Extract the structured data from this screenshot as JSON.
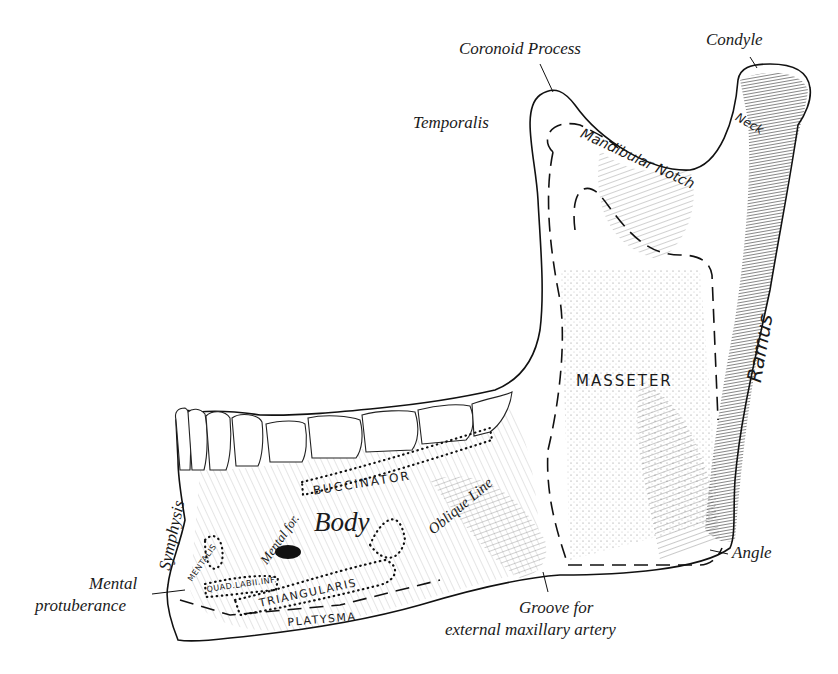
{
  "figure": {
    "colors": {
      "ink": "#1a1a1a",
      "background": "#ffffff",
      "shade": "#3a3a3a"
    },
    "labels": {
      "coronoid_process": "Coronoid Process",
      "condyle": "Condyle",
      "temporalis": "Temporalis",
      "mandibular_notch": "Mandibular Notch",
      "neck": "Neck",
      "ramus": "Ramus",
      "masseter": "MASSETER",
      "buccinator": "BUCCINATOR",
      "oblique_line": "Oblique Line",
      "body": "Body",
      "mental_foramen": "Mental for.",
      "symphysis": "Symphysis",
      "mentalis": "MENTALIS",
      "quad_labii_inf": "QUAD.LABII.INF.",
      "triangularis": "TRIANGULARIS",
      "platysma": "PLATYSMA",
      "mental_protuberance_line1": "Mental",
      "mental_protuberance_line2": "protuberance",
      "groove_line1": "Groove for",
      "groove_line2": "external maxillary artery",
      "angle": "Angle"
    }
  }
}
